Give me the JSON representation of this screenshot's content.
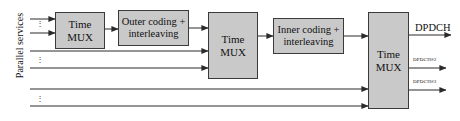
{
  "figure": {
    "type": "block-diagram",
    "background": "#ffffff",
    "block_fill": "#c9c9c9",
    "block_border": "#3a3a3a",
    "line_color": "#2b2b2b"
  },
  "side": {
    "label": "Parallel services"
  },
  "blocks": {
    "mux1": {
      "line1": "Time",
      "line2": "MUX"
    },
    "outer": {
      "line1": "Outer coding +",
      "line2": "interleaving"
    },
    "mux2": {
      "line1": "Time",
      "line2": "MUX"
    },
    "inner": {
      "line1": "Inner coding +",
      "line2": "interleaving"
    },
    "mux3": {
      "line1": "Time",
      "line2": "MUX"
    }
  },
  "outputs": {
    "dpdch1": "DPDCH",
    "dpdch2": "DPDCH#2",
    "dpdch3": "DPDCH#3"
  },
  "ellipses": {
    "group_a": "⋮",
    "group_b": "⋮",
    "group_c": "⋮"
  }
}
